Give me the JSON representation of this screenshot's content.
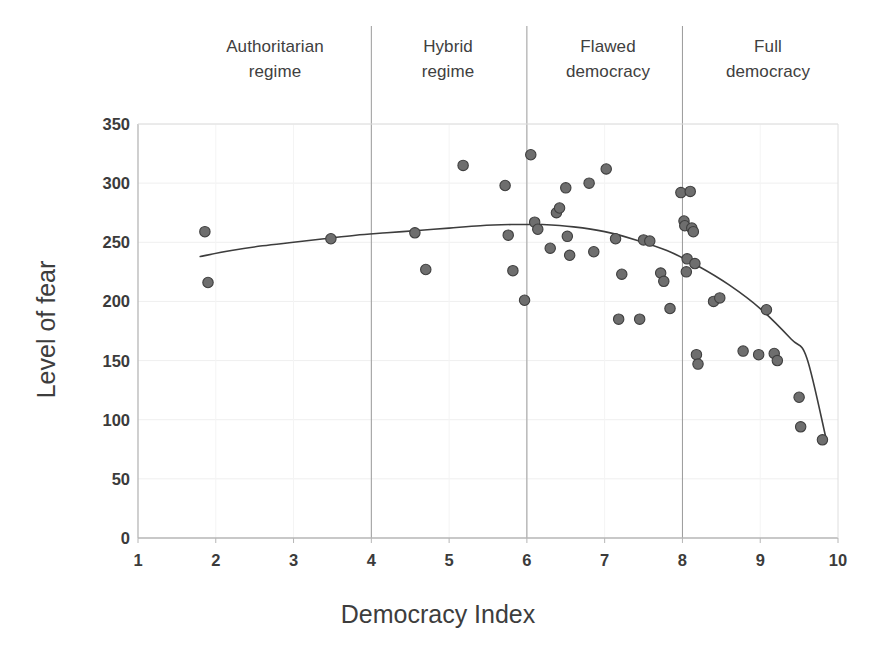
{
  "chart_data": {
    "type": "scatter",
    "title": "",
    "xlabel": "Democracy Index",
    "ylabel": "Level of fear",
    "xlim": [
      1,
      10
    ],
    "ylim": [
      0,
      350
    ],
    "xticks": [
      "1",
      "2",
      "3",
      "4",
      "5",
      "6",
      "7",
      "8",
      "9",
      "10"
    ],
    "yticks": [
      "0",
      "50",
      "100",
      "150",
      "200",
      "250",
      "300",
      "350"
    ],
    "grid": "horizontal-faint",
    "legend": "none",
    "marker": {
      "shape": "circle",
      "fill": "#6e6e6e",
      "stroke": "#3f3f3f",
      "radius": 5.2
    },
    "trendline": {
      "type": "quadratic-fit",
      "color": "#3d3d3d",
      "width": 1.6,
      "x_start": 1.8,
      "x_end": 9.85,
      "points": [
        [
          1.8,
          238
        ],
        [
          2.2,
          243
        ],
        [
          2.6,
          247
        ],
        [
          3.0,
          250
        ],
        [
          3.4,
          253
        ],
        [
          3.8,
          256
        ],
        [
          4.2,
          258
        ],
        [
          4.6,
          260
        ],
        [
          5.0,
          262
        ],
        [
          5.4,
          264
        ],
        [
          5.8,
          265
        ],
        [
          6.0,
          265
        ],
        [
          6.2,
          265
        ],
        [
          6.6,
          263
        ],
        [
          7.0,
          259
        ],
        [
          7.4,
          252
        ],
        [
          7.8,
          243
        ],
        [
          8.2,
          230
        ],
        [
          8.6,
          214
        ],
        [
          9.0,
          194
        ],
        [
          9.4,
          168
        ],
        [
          9.6,
          152
        ],
        [
          9.85,
          83
        ]
      ]
    },
    "dividers": [
      {
        "x": 4,
        "label": "authoritarian-hybrid-boundary"
      },
      {
        "x": 6,
        "label": "hybrid-flawed-boundary"
      },
      {
        "x": 8,
        "label": "flawed-full-boundary"
      }
    ],
    "regions": [
      {
        "name": "authoritarian-regime",
        "label": "Authoritarian\nregime",
        "x_range": [
          1,
          4
        ]
      },
      {
        "name": "hybrid-regime",
        "label": "Hybrid\nregime",
        "x_range": [
          4,
          6
        ]
      },
      {
        "name": "flawed-democracy",
        "label": "Flawed\ndemocracy",
        "x_range": [
          6,
          8
        ]
      },
      {
        "name": "full-democracy",
        "label": "Full\ndemocracy",
        "x_range": [
          8,
          10
        ]
      }
    ],
    "points": [
      [
        1.86,
        259
      ],
      [
        1.9,
        216
      ],
      [
        3.48,
        253
      ],
      [
        4.56,
        258
      ],
      [
        4.7,
        227
      ],
      [
        5.18,
        315
      ],
      [
        5.72,
        298
      ],
      [
        5.76,
        256
      ],
      [
        5.82,
        226
      ],
      [
        5.97,
        201
      ],
      [
        6.05,
        324
      ],
      [
        6.1,
        267
      ],
      [
        6.14,
        261
      ],
      [
        6.3,
        245
      ],
      [
        6.38,
        275
      ],
      [
        6.42,
        279
      ],
      [
        6.5,
        296
      ],
      [
        6.52,
        255
      ],
      [
        6.55,
        239
      ],
      [
        6.8,
        300
      ],
      [
        6.86,
        242
      ],
      [
        7.02,
        312
      ],
      [
        7.14,
        253
      ],
      [
        7.18,
        185
      ],
      [
        7.22,
        223
      ],
      [
        7.45,
        185
      ],
      [
        7.5,
        252
      ],
      [
        7.58,
        251
      ],
      [
        7.72,
        224
      ],
      [
        7.76,
        217
      ],
      [
        7.84,
        194
      ],
      [
        7.98,
        292
      ],
      [
        8.02,
        268
      ],
      [
        8.03,
        264
      ],
      [
        8.05,
        225
      ],
      [
        8.06,
        236
      ],
      [
        8.1,
        293
      ],
      [
        8.12,
        262
      ],
      [
        8.14,
        259
      ],
      [
        8.16,
        232
      ],
      [
        8.18,
        155
      ],
      [
        8.2,
        147
      ],
      [
        8.4,
        200
      ],
      [
        8.48,
        203
      ],
      [
        8.78,
        158
      ],
      [
        8.98,
        155
      ],
      [
        9.08,
        193
      ],
      [
        9.18,
        156
      ],
      [
        9.22,
        150
      ],
      [
        9.5,
        119
      ],
      [
        9.52,
        94
      ],
      [
        9.8,
        83
      ]
    ]
  }
}
